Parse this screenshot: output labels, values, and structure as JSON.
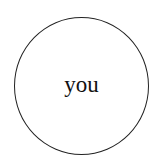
{
  "diagram": {
    "nodes": [
      {
        "id": "you",
        "label": "you",
        "shape": "circle",
        "stroke": "#222222",
        "fill": "#ffffff"
      }
    ]
  }
}
